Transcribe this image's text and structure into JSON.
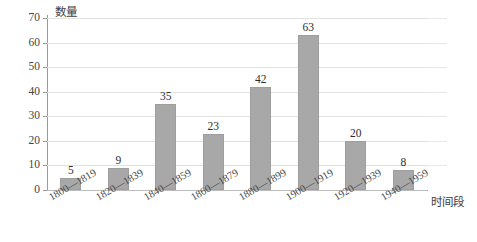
{
  "chart_data": {
    "type": "bar",
    "title": "",
    "xlabel": "时间段",
    "ylabel": "数量",
    "categories": [
      "1800—1819",
      "1820—1839",
      "1840—1859",
      "1860—1879",
      "1880—1899",
      "1900—1919",
      "1920—1939",
      "1940—1959"
    ],
    "values": [
      5,
      9,
      35,
      23,
      42,
      63,
      20,
      8
    ],
    "ylim": [
      0,
      70
    ],
    "yticks": [
      0,
      10,
      20,
      30,
      40,
      50,
      60,
      70
    ],
    "ytick_labels": [
      "0",
      "10",
      "20",
      "30",
      "40",
      "50",
      "60",
      "70"
    ],
    "value_labels": [
      "5",
      "9",
      "35",
      "23",
      "42",
      "63",
      "20",
      "8"
    ],
    "grid": true,
    "legend": false,
    "bar_color": "#a8a8a8",
    "gridline_color": "#e2e2e2",
    "axis_color": "#9a9a9a",
    "background_color": "#ffffff"
  }
}
